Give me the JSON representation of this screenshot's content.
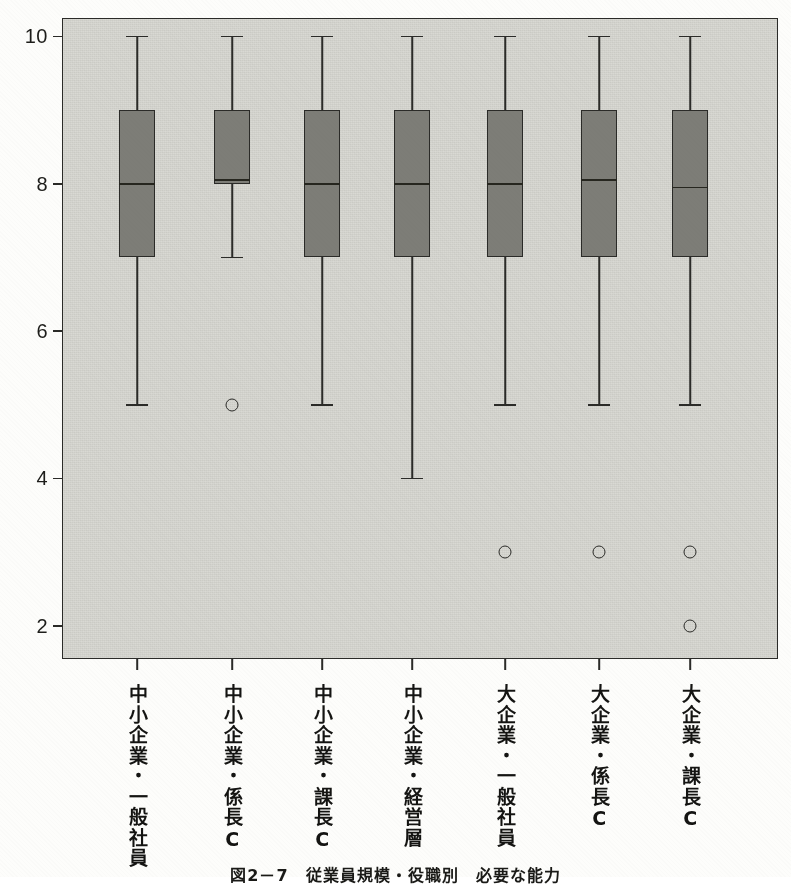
{
  "figure": {
    "caption": "図2－7　従業員規模・役職別　必要な能力",
    "background_color": "#fdfdfb",
    "panel_color": "#d9d9d3",
    "box_fill_color": "#7d7d77",
    "line_color": "#2b2b28"
  },
  "chart_data": {
    "type": "box",
    "title": "",
    "xlabel": "",
    "ylabel": "",
    "ylim": [
      1.55,
      10.25
    ],
    "y_ticks": [
      10,
      8,
      6,
      4,
      2
    ],
    "y_tick_labels": [
      "10",
      "8",
      "6",
      "4",
      "2"
    ],
    "grid": false,
    "legend": "none",
    "categories": [
      "中小企業・一般社員",
      "中小企業・係長C",
      "中小企業・課長C",
      "中小企業・経営層",
      "大企業・一般社員",
      "大企業・係長C",
      "大企業・課長C"
    ],
    "boxes": [
      {
        "category": "中小企業・一般社員",
        "whisker_low": 5,
        "q1": 7,
        "median": 8,
        "q3": 9,
        "whisker_high": 10,
        "outliers": []
      },
      {
        "category": "中小企業・係長C",
        "whisker_low": 7,
        "q1": 8,
        "median": 8.05,
        "q3": 9,
        "whisker_high": 10,
        "outliers": [
          5
        ]
      },
      {
        "category": "中小企業・課長C",
        "whisker_low": 5,
        "q1": 7,
        "median": 8,
        "q3": 9,
        "whisker_high": 10,
        "outliers": []
      },
      {
        "category": "中小企業・経営層",
        "whisker_low": 4,
        "q1": 7,
        "median": 8,
        "q3": 9,
        "whisker_high": 10,
        "outliers": []
      },
      {
        "category": "大企業・一般社員",
        "whisker_low": 5,
        "q1": 7,
        "median": 8,
        "q3": 9,
        "whisker_high": 10,
        "outliers": [
          3
        ]
      },
      {
        "category": "大企業・係長C",
        "whisker_low": 5,
        "q1": 7,
        "median": 8.05,
        "q3": 9,
        "whisker_high": 10,
        "outliers": [
          3
        ]
      },
      {
        "category": "大企業・課長C",
        "whisker_low": 5,
        "q1": 7,
        "median": 7.95,
        "q3": 9,
        "whisker_high": 10,
        "outliers": [
          3,
          2
        ]
      }
    ]
  }
}
